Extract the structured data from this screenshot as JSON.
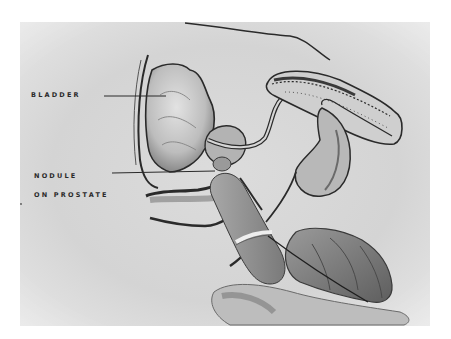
{
  "figure": {
    "type": "medical illustration",
    "labels": [
      {
        "id": "bladder",
        "text": "BLADDER"
      },
      {
        "id": "nodule",
        "text": "NODULE"
      },
      {
        "id": "prostate",
        "text": "ON PROSTATE"
      }
    ],
    "structures": [
      "bladder",
      "prostate",
      "urethra",
      "penis",
      "scrotum/testis",
      "rectum",
      "gloved hand",
      "index finger"
    ],
    "palette": {
      "background": "#d8d8d8",
      "ink": "#2a2a2a",
      "shade": "#7a7a7a",
      "paper": "#ffffff"
    }
  }
}
